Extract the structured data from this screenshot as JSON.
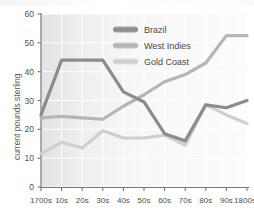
{
  "chart_data": {
    "type": "line",
    "title": "",
    "subtitle": "",
    "xlabel": "",
    "ylabel": "current pounds sterling",
    "categories": [
      "1700s",
      "10s",
      "20s",
      "30s",
      "40s",
      "50s",
      "60s",
      "70s",
      "80s",
      "90s",
      "1800s"
    ],
    "xlim": [
      0,
      10
    ],
    "ylim": [
      0,
      60
    ],
    "yticks": [
      0,
      10,
      20,
      30,
      40,
      50,
      60
    ],
    "ytick_labels": [
      "0",
      "10",
      "20",
      "30",
      "40",
      "50",
      "60"
    ],
    "grid": true,
    "legend_position": "top-right",
    "series": [
      {
        "name": "Brazil",
        "color": "#8c8c8c",
        "values": [
          25,
          44,
          44,
          44,
          33,
          29.5,
          18.5,
          16,
          28.5,
          27.5,
          30
        ]
      },
      {
        "name": "West Indies",
        "color": "#b5b5b5",
        "values": [
          24,
          24.5,
          24,
          23.5,
          28,
          32,
          36.5,
          39,
          43,
          52.5,
          52.5
        ]
      },
      {
        "name": "Gold Coast",
        "color": "#cfcfcf",
        "values": [
          11.5,
          15.5,
          13.5,
          19.5,
          17,
          17,
          18,
          14.5,
          28.5,
          25,
          22
        ]
      }
    ]
  },
  "legend": {
    "items": [
      {
        "label": "Brazil",
        "color": "#8c8c8c"
      },
      {
        "label": "West Indies",
        "color": "#b5b5b5"
      },
      {
        "label": "Gold Coast",
        "color": "#cfcfcf"
      }
    ]
  },
  "axes": {
    "y_title": "current pounds sterling",
    "y_tick_0": "0",
    "y_tick_1": "10",
    "y_tick_2": "20",
    "y_tick_3": "30",
    "y_tick_4": "40",
    "y_tick_5": "50",
    "y_tick_6": "60",
    "x_tick_0": "1700s",
    "x_tick_1": "10s",
    "x_tick_2": "20s",
    "x_tick_3": "30s",
    "x_tick_4": "40s",
    "x_tick_5": "50s",
    "x_tick_6": "60s",
    "x_tick_7": "70s",
    "x_tick_8": "80s",
    "x_tick_9": "90s",
    "x_tick_10": "1800s"
  },
  "colors": {
    "brazil": "#8c8c8c",
    "west_indies": "#b5b5b5",
    "gold_coast": "#cfcfcf",
    "axis": "#6e6e6e",
    "grid": "#ffffff",
    "plot_bg_left": "#e4e4e4",
    "plot_bg_right": "#fbfbfb"
  }
}
